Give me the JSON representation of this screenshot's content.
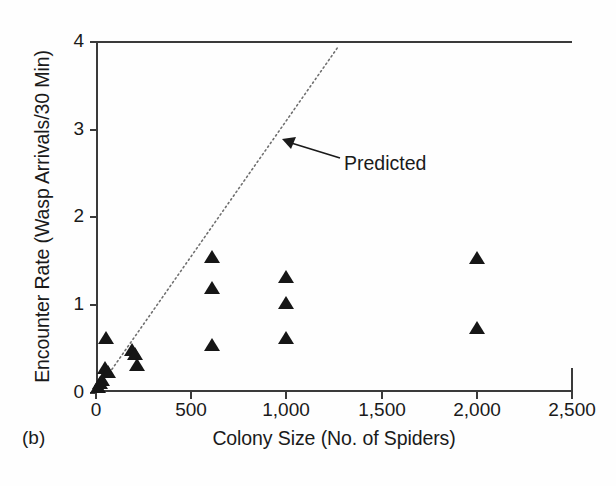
{
  "panel": {
    "label": "(b)"
  },
  "chart_data": {
    "type": "scatter",
    "title": "",
    "xlabel": "Colony Size (No. of Spiders)",
    "ylabel": "Encounter Rate (Wasp Arrivals/30 Min)",
    "xlim": [
      0,
      2500
    ],
    "ylim": [
      0,
      4
    ],
    "xticks": [
      0,
      500,
      1000,
      1500,
      2000,
      2500
    ],
    "xticklabels": [
      "0",
      "500",
      "1,000",
      "1,500",
      "2,000",
      "2,500"
    ],
    "yticks": [
      0,
      1,
      2,
      3,
      4
    ],
    "yticklabels": [
      "0",
      "1",
      "2",
      "3",
      "4"
    ],
    "grid": false,
    "legend": false,
    "marker": "triangle-up",
    "marker_color": "#161616",
    "series": [
      {
        "name": "Observed encounter rate",
        "points": [
          {
            "x": 10,
            "y": 0.05
          },
          {
            "x": 22,
            "y": 0.09
          },
          {
            "x": 30,
            "y": 0.13
          },
          {
            "x": 45,
            "y": 0.26
          },
          {
            "x": 50,
            "y": 0.6
          },
          {
            "x": 62,
            "y": 0.22
          },
          {
            "x": 190,
            "y": 0.47
          },
          {
            "x": 205,
            "y": 0.42
          },
          {
            "x": 215,
            "y": 0.3
          },
          {
            "x": 610,
            "y": 1.53
          },
          {
            "x": 610,
            "y": 1.17
          },
          {
            "x": 610,
            "y": 0.52
          },
          {
            "x": 1000,
            "y": 1.3
          },
          {
            "x": 1000,
            "y": 1.0
          },
          {
            "x": 1000,
            "y": 0.6
          },
          {
            "x": 2000,
            "y": 1.52
          },
          {
            "x": 2000,
            "y": 0.72
          }
        ]
      }
    ],
    "annotations": [
      {
        "name": "predicted-line",
        "type": "line",
        "style": "dotted",
        "label": "Predicted",
        "x0": 0,
        "y0": 0,
        "x1": 1270,
        "y1": 3.93
      }
    ]
  }
}
